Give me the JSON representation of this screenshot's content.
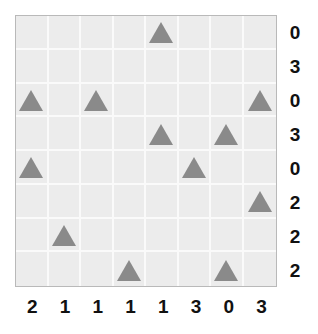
{
  "puzzle": {
    "rows": 8,
    "cols": 8,
    "row_clues": [
      "0",
      "3",
      "0",
      "3",
      "0",
      "2",
      "2",
      "2"
    ],
    "col_clues": [
      "2",
      "1",
      "1",
      "1",
      "1",
      "3",
      "0",
      "3"
    ],
    "tree_icon": "triangle-icon",
    "trees": [
      [
        0,
        4
      ],
      [
        2,
        0
      ],
      [
        2,
        2
      ],
      [
        2,
        7
      ],
      [
        3,
        4
      ],
      [
        3,
        6
      ],
      [
        4,
        0
      ],
      [
        4,
        5
      ],
      [
        5,
        7
      ],
      [
        6,
        1
      ],
      [
        7,
        3
      ],
      [
        7,
        6
      ]
    ]
  },
  "colors": {
    "cell_background": "#ececec",
    "grid_line": "#fafafa",
    "grid_border": "#b9b9b9",
    "triangle": "#8a8a8a",
    "clue_text": "#111111"
  }
}
